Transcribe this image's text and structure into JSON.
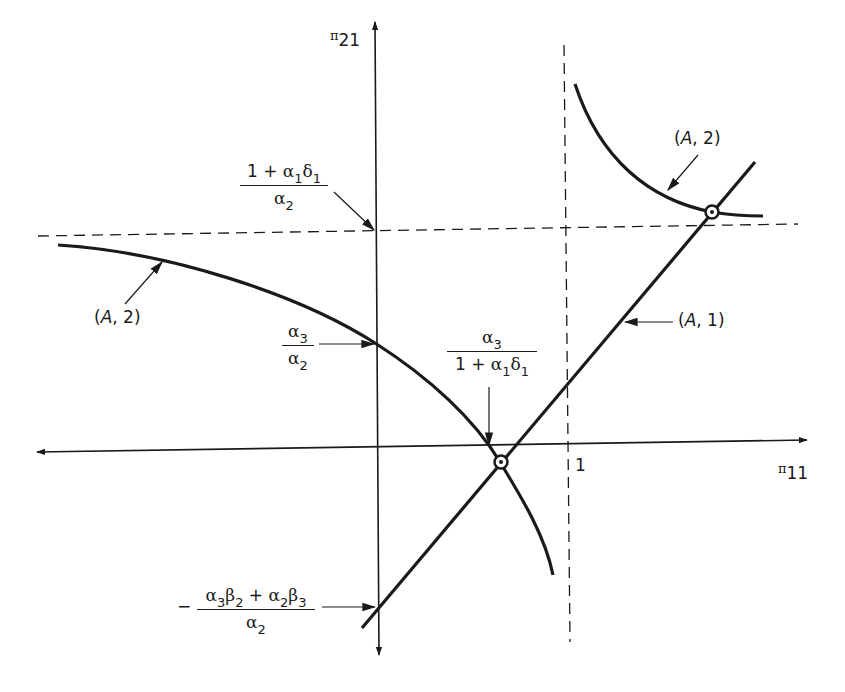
{
  "diagram": {
    "axes": {
      "x_axis": {
        "symbol": "π",
        "subscript": "11",
        "label": "π11"
      },
      "y_axis": {
        "symbol": "π",
        "subscript": "21",
        "label": "π21"
      }
    },
    "ticks": {
      "x_one": "1"
    },
    "curves": {
      "line_A1": {
        "label_open": "(",
        "label_italic": "A",
        "label_rest": ", 1)",
        "label": "(A, 1)"
      },
      "curve_A2_left": {
        "label_open": "(",
        "label_italic": "A",
        "label_rest": ", 2)",
        "label": "(A, 2)"
      },
      "curve_A2_right": {
        "label_open": "(",
        "label_italic": "A",
        "label_rest": ", 2)",
        "label": "(A, 2)"
      }
    },
    "annotations": {
      "asymptote_y": {
        "numerator": "1 + α1δ1",
        "num_parts": {
          "one_plus": "1 + ",
          "a": "α",
          "a_sub": "1",
          "d": "δ",
          "d_sub": "1"
        },
        "denominator": "α2",
        "den_parts": {
          "a": "α",
          "a_sub": "2"
        }
      },
      "y_intercept_curve": {
        "numerator": "α3",
        "num_parts": {
          "a": "α",
          "a_sub": "3"
        },
        "denominator": "α2",
        "den_parts": {
          "a": "α",
          "a_sub": "2"
        }
      },
      "x_intercept_curve": {
        "numerator": "α3",
        "num_parts": {
          "a": "α",
          "a_sub": "3"
        },
        "denominator": "1 + α1δ1",
        "den_parts": {
          "one_plus": "1 + ",
          "a": "α",
          "a_sub": "1",
          "d": "δ",
          "d_sub": "1"
        }
      },
      "y_intercept_line": {
        "sign": "−",
        "numerator": "α3β2 + α2β3",
        "num_parts": {
          "a1": "α",
          "a1_sub": "3",
          "b1": "β",
          "b1_sub": "2",
          "plus": " + ",
          "a2": "α",
          "a2_sub": "2",
          "b2": "β",
          "b2_sub": "3"
        },
        "denominator": "α2",
        "den_parts": {
          "a": "α",
          "a_sub": "2"
        }
      }
    },
    "colors": {
      "ink": "#1a1a1a",
      "background": "#ffffff"
    }
  }
}
